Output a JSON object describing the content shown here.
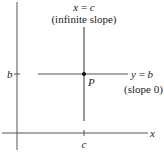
{
  "diagram": {
    "title_vertical": "x = c",
    "title_vertical_parts": [
      "x",
      " = ",
      "c"
    ],
    "note_vertical": "(infinite slope)",
    "label_horizontal_parts": [
      "y",
      " = ",
      "b"
    ],
    "label_horizontal": "y = b",
    "note_horizontal": "(slope 0)",
    "point_label": "P",
    "y_tick_label": "b",
    "x_tick_label": "c",
    "x_axis_label": "x",
    "colors": {
      "line": "#555555",
      "text": "#222222",
      "point": "#111111"
    }
  }
}
